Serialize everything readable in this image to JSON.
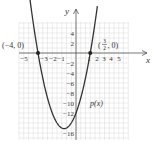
{
  "chart_data": {
    "type": "line",
    "title": "",
    "xlabel": "x",
    "ylabel": "y",
    "function_label": "p(x)",
    "function": "p(x) = (2x - 3)(x + 4) = 2x^2 + 5x - 12",
    "xlim": [
      -6,
      5.5
    ],
    "ylim": [
      -17.4,
      6.2
    ],
    "grid": true,
    "x_ticks": [
      -5,
      -3,
      -2,
      -1,
      1,
      2,
      3,
      4,
      5
    ],
    "x_tick_labels": [
      "−5",
      "−3",
      "−2",
      "−1",
      "1",
      "2",
      "3",
      "4",
      "5"
    ],
    "y_ticks": [
      4,
      2,
      -2,
      -4,
      -6,
      -8,
      -10,
      -12,
      -16
    ],
    "y_tick_labels": [
      "4",
      "2",
      "−2",
      "−4",
      "−6",
      "−8",
      "−10",
      "−12",
      "−16"
    ],
    "points": [
      {
        "x": -4,
        "y": 0,
        "label": "(−4, 0)"
      },
      {
        "x": 1.5,
        "y": 0,
        "label_parts": {
          "open": "(",
          "num": "3",
          "den": "2",
          "close": ", 0)"
        }
      }
    ],
    "series": [
      {
        "name": "p(x)",
        "x": [
          -4.8,
          -4,
          -3,
          -2,
          -1.25,
          -1,
          0,
          1,
          1.5,
          2.2
        ],
        "y": [
          6.08,
          0,
          -9,
          -14,
          -15.125,
          -15,
          -12,
          -5,
          0,
          8.68
        ]
      }
    ],
    "colors": {
      "curve": "#333333",
      "axis": "#555555",
      "grid": "#d8d8d8"
    }
  }
}
